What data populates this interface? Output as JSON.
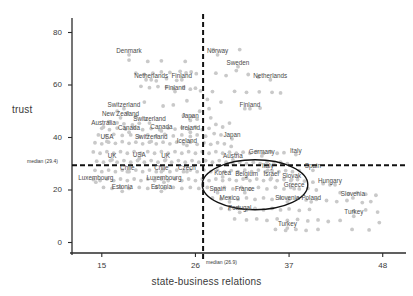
{
  "chart_data": {
    "type": "scatter",
    "title": "",
    "xlabel": "state-business relations",
    "ylabel": "trust",
    "xlim": [
      11.5,
      50.5
    ],
    "ylim": [
      -4,
      84
    ],
    "xticks": [
      15,
      26,
      37,
      48
    ],
    "yticks": [
      0,
      20,
      40,
      60,
      80
    ],
    "grid": false,
    "legend": "none",
    "annotations": {
      "x_median_label": "median (26.9)",
      "y_median_label": "median (29.4)",
      "x_median_value": 26.9,
      "y_median_value": 29.4,
      "ellipse": {
        "cx": 33.0,
        "cy": 22.0,
        "rx": 6.2,
        "ry": 9.5
      }
    },
    "point_color": "#c9c9c9",
    "label_color": "#4a4a4a",
    "axis_color": "#2b2b2b",
    "labeled_points": [
      {
        "label": "Denmark",
        "x": 18.2,
        "y": 71.5
      },
      {
        "label": "Norway",
        "x": 28.6,
        "y": 71.5
      },
      {
        "label": "Sweden",
        "x": 31.0,
        "y": 67.0
      },
      {
        "label": "Netherlands",
        "x": 20.8,
        "y": 62.0
      },
      {
        "label": "Finland",
        "x": 24.4,
        "y": 62.0
      },
      {
        "label": "Netherlands",
        "x": 34.8,
        "y": 62.0
      },
      {
        "label": "Finland",
        "x": 23.6,
        "y": 57.5
      },
      {
        "label": "Switzerland",
        "x": 17.6,
        "y": 51.0
      },
      {
        "label": "Finland",
        "x": 32.4,
        "y": 51.0
      },
      {
        "label": "New Zealand",
        "x": 17.2,
        "y": 47.5
      },
      {
        "label": "Switzerland",
        "x": 20.6,
        "y": 45.5
      },
      {
        "label": "Japan",
        "x": 25.4,
        "y": 46.5
      },
      {
        "label": "Australia",
        "x": 15.2,
        "y": 44.0
      },
      {
        "label": "Canada",
        "x": 18.2,
        "y": 42.0
      },
      {
        "label": "Canada",
        "x": 22.0,
        "y": 42.5
      },
      {
        "label": "Ireland",
        "x": 25.4,
        "y": 42.0
      },
      {
        "label": "USA",
        "x": 15.6,
        "y": 38.5
      },
      {
        "label": "Switzerland",
        "x": 20.8,
        "y": 38.5
      },
      {
        "label": "Iceland",
        "x": 25.0,
        "y": 37.0
      },
      {
        "label": "Japan",
        "x": 30.3,
        "y": 39.5
      },
      {
        "label": "Germany",
        "x": 33.8,
        "y": 33.0
      },
      {
        "label": "Italy",
        "x": 37.8,
        "y": 33.5
      },
      {
        "label": "UK",
        "x": 16.2,
        "y": 31.5
      },
      {
        "label": "USA",
        "x": 19.4,
        "y": 32.0
      },
      {
        "label": "UK",
        "x": 22.5,
        "y": 31.5
      },
      {
        "label": "Austria",
        "x": 30.4,
        "y": 31.5
      },
      {
        "label": "Chile",
        "x": 18.0,
        "y": 27.0
      },
      {
        "label": "Chile",
        "x": 22.0,
        "y": 27.0
      },
      {
        "label": "Czech",
        "x": 25.0,
        "y": 27.0
      },
      {
        "label": "Italy",
        "x": 34.5,
        "y": 27.5
      },
      {
        "label": "Spain",
        "x": 39.8,
        "y": 27.5
      },
      {
        "label": "Korea",
        "x": 29.2,
        "y": 25.0
      },
      {
        "label": "Belgium",
        "x": 32.0,
        "y": 24.5
      },
      {
        "label": "Israel",
        "x": 34.9,
        "y": 24.5
      },
      {
        "label": "Slovak",
        "x": 37.3,
        "y": 24.0
      },
      {
        "label": "Luxembourg",
        "x": 14.3,
        "y": 23.0
      },
      {
        "label": "Luxembourg",
        "x": 22.3,
        "y": 23.0
      },
      {
        "label": "Hungary",
        "x": 41.8,
        "y": 22.0
      },
      {
        "label": "Greece",
        "x": 37.6,
        "y": 20.5
      },
      {
        "label": "Estonia",
        "x": 17.4,
        "y": 19.5
      },
      {
        "label": "Estonia",
        "x": 22.0,
        "y": 19.5
      },
      {
        "label": "Spain",
        "x": 28.6,
        "y": 19.0
      },
      {
        "label": "France",
        "x": 31.8,
        "y": 19.0
      },
      {
        "label": "Slovenia",
        "x": 44.5,
        "y": 17.0
      },
      {
        "label": "Mexico",
        "x": 30.0,
        "y": 15.5
      },
      {
        "label": "Slovenia",
        "x": 36.8,
        "y": 15.5
      },
      {
        "label": "Poland",
        "x": 39.6,
        "y": 15.5
      },
      {
        "label": "Portugal",
        "x": 31.2,
        "y": 11.5
      },
      {
        "label": "Turkey",
        "x": 44.6,
        "y": 10.0
      },
      {
        "label": "Turkey",
        "x": 36.8,
        "y": 5.5
      }
    ],
    "cloud_points": [
      [
        18.2,
        69.5
      ],
      [
        20.4,
        69.0
      ],
      [
        22.0,
        69.2
      ],
      [
        24.8,
        69.0
      ],
      [
        28.1,
        73.5
      ],
      [
        31.2,
        73.5
      ],
      [
        19.0,
        64.5
      ],
      [
        20.0,
        64.0
      ],
      [
        21.0,
        64.5
      ],
      [
        22.0,
        65.0
      ],
      [
        23.0,
        64.8
      ],
      [
        24.2,
        65.2
      ],
      [
        24.9,
        64.6
      ],
      [
        25.5,
        65.0
      ],
      [
        26.1,
        64.3
      ],
      [
        28.4,
        64.5
      ],
      [
        29.6,
        63.6
      ],
      [
        30.8,
        65.5
      ],
      [
        32.2,
        64.0
      ],
      [
        33.4,
        63.0
      ],
      [
        20.2,
        62.0
      ],
      [
        21.4,
        61.6
      ],
      [
        22.6,
        62.4
      ],
      [
        23.8,
        61.8
      ],
      [
        19.6,
        59.5
      ],
      [
        20.6,
        59.0
      ],
      [
        21.6,
        59.4
      ],
      [
        22.6,
        59.2
      ],
      [
        23.4,
        58.6
      ],
      [
        24.6,
        59.2
      ],
      [
        25.4,
        58.4
      ],
      [
        26.0,
        58.8
      ],
      [
        26.6,
        57.8
      ],
      [
        28.0,
        57.5
      ],
      [
        30.6,
        57.6
      ],
      [
        32.0,
        57.2
      ],
      [
        33.5,
        57.4
      ],
      [
        35.0,
        57.2
      ],
      [
        36.0,
        57.0
      ],
      [
        31.8,
        51.0
      ],
      [
        33.6,
        51.2
      ],
      [
        16.8,
        50.0
      ],
      [
        18.0,
        49.4
      ],
      [
        19.0,
        48.0
      ],
      [
        20.2,
        47.0
      ],
      [
        15.8,
        46.0
      ],
      [
        16.8,
        45.6
      ],
      [
        17.6,
        45.2
      ],
      [
        18.6,
        44.8
      ],
      [
        19.4,
        45.4
      ],
      [
        24.6,
        48.5
      ],
      [
        25.6,
        48.0
      ],
      [
        26.2,
        47.0
      ],
      [
        15.0,
        43.5
      ],
      [
        15.9,
        43.0
      ],
      [
        16.8,
        43.6
      ],
      [
        17.8,
        43.2
      ],
      [
        18.8,
        43.8
      ],
      [
        19.8,
        43.0
      ],
      [
        20.8,
        43.4
      ],
      [
        21.8,
        43.0
      ],
      [
        22.8,
        43.6
      ],
      [
        23.6,
        43.2
      ],
      [
        24.4,
        43.8
      ],
      [
        25.2,
        43.2
      ],
      [
        26.0,
        44.0
      ],
      [
        26.8,
        43.0
      ],
      [
        27.6,
        43.5
      ],
      [
        14.6,
        41.0
      ],
      [
        15.5,
        40.6
      ],
      [
        16.4,
        41.2
      ],
      [
        17.4,
        40.8
      ],
      [
        18.4,
        41.0
      ],
      [
        19.4,
        40.4
      ],
      [
        20.4,
        41.0
      ],
      [
        21.4,
        40.6
      ],
      [
        22.4,
        41.2
      ],
      [
        23.4,
        40.6
      ],
      [
        24.4,
        41.0
      ],
      [
        25.4,
        40.4
      ],
      [
        26.2,
        41.0
      ],
      [
        27.2,
        40.5
      ],
      [
        28.2,
        41.5
      ],
      [
        29.0,
        41.0
      ],
      [
        14.2,
        38.0
      ],
      [
        15.0,
        37.6
      ],
      [
        15.8,
        38.2
      ],
      [
        16.6,
        37.8
      ],
      [
        17.4,
        38.4
      ],
      [
        18.2,
        37.8
      ],
      [
        19.0,
        38.2
      ],
      [
        19.8,
        37.6
      ],
      [
        20.6,
        38.2
      ],
      [
        21.4,
        37.6
      ],
      [
        22.2,
        38.2
      ],
      [
        23.0,
        37.6
      ],
      [
        23.8,
        38.2
      ],
      [
        24.6,
        37.6
      ],
      [
        25.4,
        38.2
      ],
      [
        26.2,
        37.4
      ],
      [
        27.0,
        38.0
      ],
      [
        27.8,
        37.4
      ],
      [
        28.6,
        38.0
      ],
      [
        29.4,
        37.6
      ],
      [
        30.2,
        36.6
      ],
      [
        14.0,
        34.5
      ],
      [
        14.8,
        34.0
      ],
      [
        15.6,
        34.6
      ],
      [
        16.4,
        34.0
      ],
      [
        17.2,
        34.6
      ],
      [
        18.0,
        34.0
      ],
      [
        18.8,
        34.6
      ],
      [
        19.6,
        34.0
      ],
      [
        20.4,
        34.6
      ],
      [
        21.2,
        34.0
      ],
      [
        22.0,
        34.6
      ],
      [
        22.8,
        34.0
      ],
      [
        23.6,
        34.6
      ],
      [
        24.4,
        34.0
      ],
      [
        25.2,
        34.6
      ],
      [
        26.0,
        34.0
      ],
      [
        26.8,
        34.6
      ],
      [
        27.6,
        34.0
      ],
      [
        28.4,
        34.6
      ],
      [
        29.2,
        34.0
      ],
      [
        30.0,
        34.4
      ],
      [
        30.8,
        34.0
      ],
      [
        31.6,
        34.4
      ],
      [
        32.4,
        34.0
      ],
      [
        33.2,
        34.6
      ],
      [
        34.0,
        34.0
      ],
      [
        34.8,
        34.6
      ],
      [
        35.6,
        34.0
      ],
      [
        36.4,
        34.2
      ],
      [
        14.4,
        31.0
      ],
      [
        15.2,
        30.6
      ],
      [
        16.0,
        31.2
      ],
      [
        16.8,
        30.6
      ],
      [
        17.6,
        31.2
      ],
      [
        18.4,
        30.6
      ],
      [
        19.2,
        31.2
      ],
      [
        20.0,
        30.6
      ],
      [
        20.8,
        31.2
      ],
      [
        21.6,
        30.6
      ],
      [
        22.4,
        31.2
      ],
      [
        23.2,
        30.6
      ],
      [
        24.0,
        31.2
      ],
      [
        24.8,
        30.6
      ],
      [
        25.6,
        31.2
      ],
      [
        26.4,
        30.6
      ],
      [
        27.2,
        31.2
      ],
      [
        28.0,
        30.6
      ],
      [
        28.8,
        31.2
      ],
      [
        29.6,
        30.6
      ],
      [
        30.4,
        30.0
      ],
      [
        31.2,
        30.6
      ],
      [
        32.0,
        30.0
      ],
      [
        32.8,
        30.6
      ],
      [
        33.6,
        30.0
      ],
      [
        34.4,
        30.6
      ],
      [
        35.2,
        30.0
      ],
      [
        36.0,
        30.6
      ],
      [
        36.8,
        30.0
      ],
      [
        14.2,
        27.5
      ],
      [
        15.0,
        27.0
      ],
      [
        15.8,
        27.6
      ],
      [
        16.6,
        27.0
      ],
      [
        17.4,
        27.6
      ],
      [
        18.2,
        27.0
      ],
      [
        19.0,
        27.6
      ],
      [
        19.8,
        27.0
      ],
      [
        20.6,
        27.6
      ],
      [
        21.4,
        27.0
      ],
      [
        22.2,
        27.6
      ],
      [
        23.0,
        27.0
      ],
      [
        23.8,
        27.6
      ],
      [
        24.6,
        27.0
      ],
      [
        25.4,
        27.6
      ],
      [
        26.2,
        27.0
      ],
      [
        27.0,
        27.6
      ],
      [
        27.8,
        27.0
      ],
      [
        28.6,
        27.6
      ],
      [
        29.4,
        27.0
      ],
      [
        30.2,
        27.4
      ],
      [
        31.0,
        27.0
      ],
      [
        31.8,
        27.6
      ],
      [
        32.6,
        27.0
      ],
      [
        33.4,
        27.6
      ],
      [
        34.2,
        27.0
      ],
      [
        35.0,
        27.4
      ],
      [
        35.8,
        27.0
      ],
      [
        36.6,
        27.4
      ],
      [
        37.4,
        27.0
      ],
      [
        38.2,
        27.4
      ],
      [
        14.0,
        24.0
      ],
      [
        14.8,
        23.6
      ],
      [
        15.6,
        24.2
      ],
      [
        16.4,
        23.6
      ],
      [
        17.2,
        24.2
      ],
      [
        18.0,
        23.6
      ],
      [
        18.8,
        24.2
      ],
      [
        19.6,
        23.6
      ],
      [
        20.4,
        24.2
      ],
      [
        21.2,
        23.6
      ],
      [
        22.0,
        24.2
      ],
      [
        22.8,
        23.6
      ],
      [
        23.6,
        24.2
      ],
      [
        24.4,
        23.6
      ],
      [
        25.2,
        24.2
      ],
      [
        26.0,
        23.6
      ],
      [
        26.8,
        24.2
      ],
      [
        27.6,
        23.6
      ],
      [
        28.4,
        24.2
      ],
      [
        29.2,
        23.6
      ],
      [
        30.0,
        24.0
      ],
      [
        30.8,
        23.6
      ],
      [
        31.6,
        24.2
      ],
      [
        32.4,
        23.6
      ],
      [
        33.2,
        24.2
      ],
      [
        34.0,
        23.6
      ],
      [
        34.8,
        24.0
      ],
      [
        35.6,
        23.6
      ],
      [
        36.4,
        24.0
      ],
      [
        37.2,
        23.6
      ],
      [
        38.0,
        24.0
      ],
      [
        38.8,
        23.4
      ],
      [
        39.8,
        23.0
      ],
      [
        41.0,
        22.4
      ],
      [
        42.4,
        22.0
      ],
      [
        15.2,
        21.0
      ],
      [
        16.2,
        20.6
      ],
      [
        17.2,
        21.0
      ],
      [
        18.2,
        20.6
      ],
      [
        19.4,
        21.0
      ],
      [
        20.4,
        20.6
      ],
      [
        21.4,
        21.0
      ],
      [
        22.4,
        20.6
      ],
      [
        23.4,
        21.0
      ],
      [
        24.4,
        20.6
      ],
      [
        25.4,
        21.0
      ],
      [
        26.4,
        20.6
      ],
      [
        27.4,
        21.0
      ],
      [
        28.4,
        20.4
      ],
      [
        29.4,
        21.0
      ],
      [
        30.4,
        20.4
      ],
      [
        31.4,
        21.0
      ],
      [
        32.4,
        20.4
      ],
      [
        33.4,
        21.0
      ],
      [
        34.4,
        20.4
      ],
      [
        35.4,
        21.0
      ],
      [
        36.4,
        20.4
      ],
      [
        37.2,
        21.0
      ],
      [
        38.2,
        20.4
      ],
      [
        39.2,
        20.6
      ],
      [
        40.2,
        20.0
      ],
      [
        43.0,
        19.0
      ],
      [
        44.0,
        18.6
      ],
      [
        45.0,
        19.0
      ],
      [
        46.0,
        18.4
      ],
      [
        47.2,
        18.0
      ],
      [
        28.0,
        17.0
      ],
      [
        29.0,
        16.6
      ],
      [
        30.0,
        17.0
      ],
      [
        31.0,
        16.4
      ],
      [
        32.0,
        17.0
      ],
      [
        33.0,
        16.4
      ],
      [
        34.0,
        17.0
      ],
      [
        35.0,
        16.4
      ],
      [
        36.0,
        17.0
      ],
      [
        37.0,
        16.4
      ],
      [
        38.0,
        16.8
      ],
      [
        39.0,
        16.2
      ],
      [
        40.2,
        16.4
      ],
      [
        41.4,
        16.0
      ],
      [
        42.6,
        15.6
      ],
      [
        43.8,
        16.0
      ],
      [
        45.6,
        15.2
      ],
      [
        46.6,
        15.6
      ],
      [
        29.0,
        13.0
      ],
      [
        30.0,
        12.6
      ],
      [
        31.0,
        13.0
      ],
      [
        32.0,
        12.4
      ],
      [
        33.0,
        13.0
      ],
      [
        34.0,
        12.4
      ],
      [
        35.0,
        13.0
      ],
      [
        36.0,
        12.4
      ],
      [
        37.0,
        12.8
      ],
      [
        38.2,
        12.2
      ],
      [
        39.4,
        12.6
      ],
      [
        44.6,
        12.0
      ],
      [
        46.0,
        12.4
      ],
      [
        47.4,
        11.6
      ],
      [
        30.6,
        9.0
      ],
      [
        32.0,
        8.6
      ],
      [
        33.2,
        9.0
      ],
      [
        34.4,
        8.4
      ],
      [
        35.6,
        9.0
      ],
      [
        36.8,
        8.4
      ],
      [
        38.0,
        8.8
      ],
      [
        39.2,
        8.2
      ],
      [
        40.4,
        8.6
      ],
      [
        41.6,
        8.0
      ],
      [
        43.0,
        8.4
      ],
      [
        47.6,
        7.6
      ],
      [
        35.4,
        5.0
      ],
      [
        36.6,
        4.6
      ],
      [
        37.8,
        5.0
      ],
      [
        39.0,
        4.6
      ],
      [
        40.4,
        5.0
      ],
      [
        44.4,
        5.0
      ],
      [
        46.4,
        4.8
      ],
      [
        22.2,
        52.0
      ],
      [
        23.4,
        52.4
      ],
      [
        20.0,
        53.5
      ],
      [
        25.0,
        54.0
      ],
      [
        27.4,
        54.5
      ],
      [
        29.0,
        53.5
      ],
      [
        26.5,
        50.0
      ],
      [
        27.6,
        51.0
      ],
      [
        28.4,
        45.0
      ],
      [
        29.2,
        44.0
      ],
      [
        30.0,
        45.5
      ],
      [
        27.8,
        47.5
      ]
    ]
  }
}
